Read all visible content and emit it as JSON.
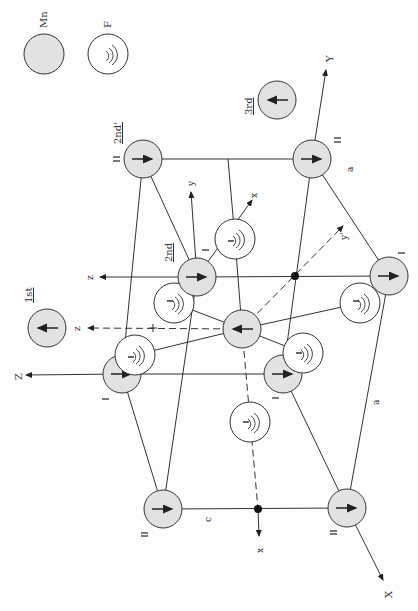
{
  "figure": {
    "orientation": "rotated 90 degrees counter-clockwise",
    "colors": {
      "mn_fill": "#e2e2e2",
      "f_fill": "#ffffff",
      "stroke": "#333333"
    }
  },
  "legend": {
    "mn_label": "Mn",
    "f_label": "F"
  },
  "neighbor_labels": {
    "first": "1st",
    "second": "2nd",
    "second_prime": "2nd'",
    "third": "3rd"
  },
  "axes": {
    "X": "X",
    "Y": "Y",
    "Z": "Z",
    "x_local": "x",
    "y_local": "y",
    "z_local": "z",
    "y_prime": "y'",
    "z_dashed": "z",
    "x_dashed": "x",
    "x_top": "x"
  },
  "dimensions": {
    "c": "c",
    "a_upper": "a",
    "a_lower": "a"
  },
  "sublattice_labels": {
    "I": "I",
    "II": "II"
  }
}
